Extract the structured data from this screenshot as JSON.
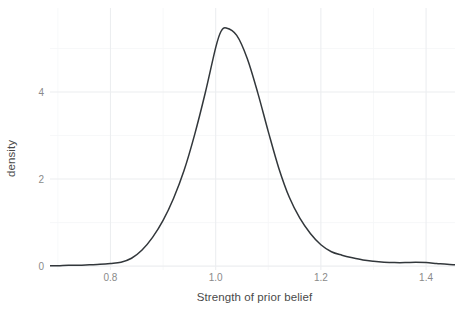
{
  "chart_data": {
    "type": "line",
    "title": "",
    "subtitle": "",
    "xlabel": "Strength of prior belief",
    "ylabel": "density",
    "xlim": [
      0.685,
      1.455
    ],
    "ylim": [
      -0.09,
      5.93
    ],
    "x_ticks": [
      0.8,
      1.0,
      1.2,
      1.4
    ],
    "x_tick_labels": [
      "0.8",
      "1.0",
      "1.2",
      "1.4"
    ],
    "y_ticks": [
      0,
      2,
      4
    ],
    "y_tick_labels": [
      "0",
      "2",
      "4"
    ],
    "x_minor_ticks": [
      0.7,
      0.9,
      1.1,
      1.3
    ],
    "y_minor_ticks": [
      1,
      3,
      5
    ],
    "grid": true,
    "legend": "none",
    "series": [
      {
        "name": "density",
        "color": "#32373b",
        "x": [
          0.685,
          0.7,
          0.72,
          0.74,
          0.76,
          0.78,
          0.8,
          0.82,
          0.84,
          0.86,
          0.88,
          0.9,
          0.92,
          0.94,
          0.96,
          0.98,
          1.0,
          1.01,
          1.02,
          1.04,
          1.06,
          1.08,
          1.1,
          1.12,
          1.14,
          1.16,
          1.18,
          1.2,
          1.22,
          1.24,
          1.26,
          1.28,
          1.3,
          1.32,
          1.34,
          1.36,
          1.38,
          1.4,
          1.42,
          1.44,
          1.455
        ],
        "y": [
          0.01,
          0.01,
          0.02,
          0.02,
          0.03,
          0.04,
          0.06,
          0.09,
          0.18,
          0.37,
          0.66,
          1.05,
          1.56,
          2.2,
          3.02,
          3.97,
          5.02,
          5.39,
          5.47,
          5.3,
          4.77,
          3.98,
          3.09,
          2.25,
          1.58,
          1.1,
          0.75,
          0.49,
          0.33,
          0.25,
          0.19,
          0.14,
          0.11,
          0.09,
          0.08,
          0.08,
          0.09,
          0.08,
          0.06,
          0.04,
          0.03
        ],
        "peak": {
          "x": 1.015,
          "y": 5.47
        }
      }
    ]
  },
  "axes": {
    "x_title": "Strength of prior belief",
    "y_title": "density"
  }
}
